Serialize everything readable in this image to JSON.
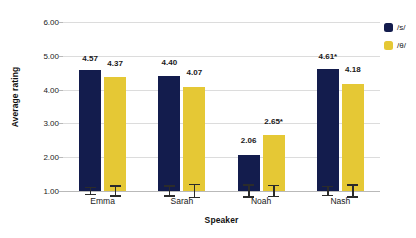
{
  "chart_data": {
    "type": "bar",
    "title": "",
    "xlabel": "Speaker",
    "ylabel": "Average rating",
    "categories": [
      "Emma",
      "Sarah",
      "Noah",
      "Nash"
    ],
    "ylim": [
      1.0,
      6.0
    ],
    "yticks": [
      "1.00",
      "2.00",
      "3.00",
      "4.00",
      "5.00",
      "6.00"
    ],
    "ytick_values": [
      1.0,
      2.0,
      3.0,
      4.0,
      5.0,
      6.0
    ],
    "grid": true,
    "legend_position": "right-top",
    "series": [
      {
        "name": "/s/",
        "color": "#131c4d",
        "values": [
          4.57,
          4.4,
          2.06,
          4.61
        ],
        "labels": [
          "4.57",
          "4.40",
          "2.06",
          "4.61*"
        ],
        "errors": [
          0.12,
          0.17,
          0.2,
          0.16
        ]
      },
      {
        "name": "/θ/",
        "color": "#e5c835",
        "values": [
          4.37,
          4.07,
          2.65,
          4.18
        ],
        "labels": [
          "4.37",
          "4.07",
          "2.65*",
          "4.18"
        ],
        "errors": [
          0.17,
          0.21,
          0.19,
          0.2
        ]
      }
    ],
    "annotations": [
      "* marks significance"
    ]
  },
  "legend": {
    "items": [
      {
        "label": "/s/",
        "color": "#131c4d"
      },
      {
        "label": "/θ/",
        "color": "#e5c835"
      }
    ]
  }
}
